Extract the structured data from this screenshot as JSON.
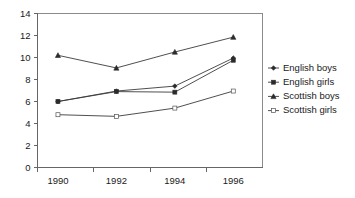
{
  "chart_data": {
    "type": "line",
    "title": "",
    "xlabel": "",
    "ylabel": "",
    "categories": [
      "1990",
      "1992",
      "1994",
      "1996"
    ],
    "x": [
      1990,
      1992,
      1994,
      1996
    ],
    "xlim": [
      1989.3,
      1997.0
    ],
    "ylim": [
      0,
      14
    ],
    "yticks": [
      0,
      2,
      4,
      6,
      8,
      10,
      12,
      14
    ],
    "xticks": [
      "1990",
      "1992",
      "1994",
      "1996"
    ],
    "grid": false,
    "legend_position": "right",
    "series": [
      {
        "name": "English boys",
        "marker": "filled-diamond",
        "values": [
          6.0,
          6.95,
          7.4,
          9.95
        ]
      },
      {
        "name": "English girls",
        "marker": "filled-square",
        "values": [
          6.0,
          6.9,
          6.85,
          9.75
        ]
      },
      {
        "name": "Scottish boys",
        "marker": "filled-triangle",
        "values": [
          10.2,
          9.05,
          10.5,
          11.85
        ]
      },
      {
        "name": "Scottish girls",
        "marker": "open-square",
        "values": [
          4.8,
          4.65,
          5.4,
          6.95
        ]
      }
    ]
  },
  "legend": {
    "items": [
      {
        "label": "English boys"
      },
      {
        "label": "English girls"
      },
      {
        "label": "Scottish boys"
      },
      {
        "label": "Scottish girls"
      }
    ]
  },
  "colors": {
    "series_stroke": "#3b3b3b",
    "axis": "#666666",
    "frame": "#8a8a8a",
    "text": "#1a1a1a",
    "background": "#ffffff"
  }
}
